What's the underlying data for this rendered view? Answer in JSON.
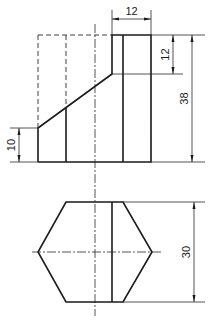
{
  "drawing": {
    "type": "orthographic projection",
    "views": [
      "front view",
      "top view"
    ],
    "dimensions": {
      "top_width": "12",
      "upper_height": "12",
      "total_height": "38",
      "left_height": "10",
      "hex_width": "30"
    },
    "colors": {
      "line": "#1a1a1a",
      "background": "#ffffff"
    }
  }
}
